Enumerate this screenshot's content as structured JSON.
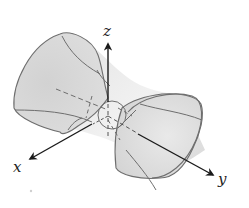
{
  "figure": {
    "axes": {
      "x": {
        "label": "x"
      },
      "y": {
        "label": "y"
      },
      "z": {
        "label": "z"
      }
    },
    "colors": {
      "surface_fill": "#d6d6d6",
      "surface_light": "#ececec",
      "stroke": "#6e6e6e",
      "axis": "#1a1a1a",
      "background": "#ffffff"
    }
  }
}
